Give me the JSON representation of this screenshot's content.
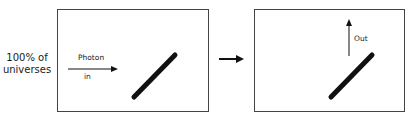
{
  "left_label": [
    "100% of",
    "universes"
  ],
  "panel_before": {
    "arrow_label_top": "Photon",
    "arrow_label_bottom": "in"
  },
  "panel_after": {
    "arrow_label": "Out"
  },
  "colors": {
    "border": "#444444",
    "ink": "#111111"
  }
}
